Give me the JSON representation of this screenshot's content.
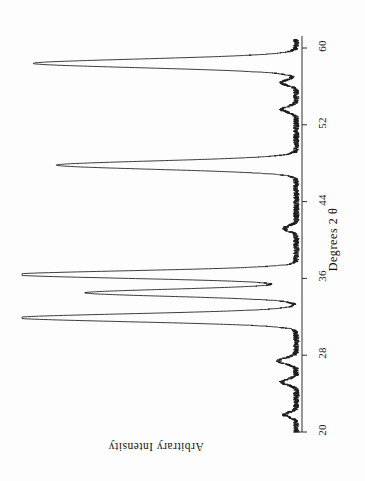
{
  "figure": {
    "kind": "xrd-diffractogram",
    "orientation": "rotated-90-clockwise",
    "background_color": "#fdfdfd",
    "trace_color": "#1a1a1a"
  },
  "chart_data": {
    "type": "line",
    "title": "",
    "subtitle": "",
    "xlabel": "Degrees 2 θ",
    "ylabel": "Arbitrary Intensity",
    "xlim": [
      20,
      61
    ],
    "ylim": [
      0,
      100
    ],
    "grid": false,
    "legend": null,
    "xticks": [
      20,
      28,
      36,
      44,
      52,
      60
    ],
    "xticklabels": [
      "20",
      "28",
      "36",
      "44",
      "52",
      "60"
    ],
    "yticks": [],
    "yticklabels": [],
    "annotations": [],
    "series": [
      {
        "name": "diffraction pattern",
        "peaks": [
          {
            "two_theta": 21.8,
            "intensity": 4,
            "width": 0.28
          },
          {
            "two_theta": 25.2,
            "intensity": 5,
            "width": 0.3
          },
          {
            "two_theta": 27.4,
            "intensity": 6,
            "width": 0.32
          },
          {
            "two_theta": 31.9,
            "intensity": 96,
            "width": 0.42
          },
          {
            "two_theta": 34.5,
            "intensity": 72,
            "width": 0.38
          },
          {
            "two_theta": 36.4,
            "intensity": 97,
            "width": 0.4
          },
          {
            "two_theta": 41.2,
            "intensity": 4,
            "width": 0.3
          },
          {
            "two_theta": 47.8,
            "intensity": 82,
            "width": 0.44
          },
          {
            "two_theta": 53.6,
            "intensity": 5,
            "width": 0.3
          },
          {
            "two_theta": 56.4,
            "intensity": 5,
            "width": 0.3
          },
          {
            "two_theta": 58.4,
            "intensity": 90,
            "width": 0.46
          }
        ],
        "baseline": 2.0,
        "noise_amplitude": 1.1
      }
    ]
  },
  "axes": {
    "x_axis_title": "Degrees  2 θ",
    "y_axis_title": "Arbitrary Intensity"
  }
}
